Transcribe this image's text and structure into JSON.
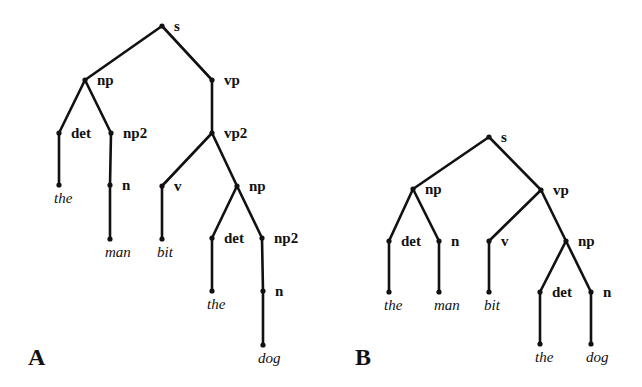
{
  "figure": {
    "panels": [
      {
        "id": "A",
        "label": "A",
        "label_pos": [
          28,
          345
        ],
        "nodes": [
          {
            "id": "s",
            "text": "s",
            "type": "cat",
            "x": 162,
            "y": 26
          },
          {
            "id": "np",
            "text": "np",
            "type": "cat",
            "x": 85,
            "y": 80
          },
          {
            "id": "vp",
            "text": "vp",
            "type": "cat",
            "x": 212,
            "y": 80
          },
          {
            "id": "det",
            "text": "det",
            "type": "cat",
            "x": 59,
            "y": 133
          },
          {
            "id": "np2",
            "text": "np2",
            "type": "cat",
            "x": 111,
            "y": 133
          },
          {
            "id": "vp2",
            "text": "vp2",
            "type": "cat",
            "x": 212,
            "y": 133
          },
          {
            "id": "the1",
            "text": "the",
            "type": "word",
            "x": 59,
            "y": 185
          },
          {
            "id": "n",
            "text": "n",
            "type": "cat",
            "x": 110,
            "y": 185
          },
          {
            "id": "v",
            "text": "v",
            "type": "cat",
            "x": 162,
            "y": 186
          },
          {
            "id": "np_b",
            "text": "np",
            "type": "cat",
            "x": 237,
            "y": 186
          },
          {
            "id": "man",
            "text": "man",
            "type": "word",
            "x": 110,
            "y": 239
          },
          {
            "id": "bit",
            "text": "bit",
            "type": "word",
            "x": 162,
            "y": 239
          },
          {
            "id": "det2",
            "text": "det",
            "type": "cat",
            "x": 212,
            "y": 238
          },
          {
            "id": "np2b",
            "text": "np2",
            "type": "cat",
            "x": 262,
            "y": 238
          },
          {
            "id": "the2",
            "text": "the",
            "type": "word",
            "x": 212,
            "y": 291
          },
          {
            "id": "n2",
            "text": "n",
            "type": "cat",
            "x": 263,
            "y": 291
          },
          {
            "id": "dog",
            "text": "dog",
            "type": "word",
            "x": 263,
            "y": 345
          }
        ],
        "edges": [
          [
            "s",
            "np"
          ],
          [
            "s",
            "vp"
          ],
          [
            "np",
            "det"
          ],
          [
            "np",
            "np2"
          ],
          [
            "vp",
            "vp2"
          ],
          [
            "det",
            "the1"
          ],
          [
            "np2",
            "n"
          ],
          [
            "n",
            "man"
          ],
          [
            "vp2",
            "v"
          ],
          [
            "vp2",
            "np_b"
          ],
          [
            "v",
            "bit"
          ],
          [
            "np_b",
            "det2"
          ],
          [
            "np_b",
            "np2b"
          ],
          [
            "det2",
            "the2"
          ],
          [
            "np2b",
            "n2"
          ],
          [
            "n2",
            "dog"
          ]
        ]
      },
      {
        "id": "B",
        "label": "B",
        "label_pos": [
          355,
          345
        ],
        "nodes": [
          {
            "id": "s",
            "text": "s",
            "type": "cat",
            "x": 489,
            "y": 137
          },
          {
            "id": "np",
            "text": "np",
            "type": "cat",
            "x": 413,
            "y": 189
          },
          {
            "id": "vp",
            "text": "vp",
            "type": "cat",
            "x": 541,
            "y": 190
          },
          {
            "id": "det",
            "text": "det",
            "type": "cat",
            "x": 389,
            "y": 241
          },
          {
            "id": "n",
            "text": "n",
            "type": "cat",
            "x": 439,
            "y": 241
          },
          {
            "id": "v",
            "text": "v",
            "type": "cat",
            "x": 489,
            "y": 241
          },
          {
            "id": "np_b",
            "text": "np",
            "type": "cat",
            "x": 566,
            "y": 241
          },
          {
            "id": "the1",
            "text": "the",
            "type": "word",
            "x": 389,
            "y": 292
          },
          {
            "id": "man",
            "text": "man",
            "type": "word",
            "x": 439,
            "y": 292
          },
          {
            "id": "bit",
            "text": "bit",
            "type": "word",
            "x": 489,
            "y": 292
          },
          {
            "id": "det2",
            "text": "det",
            "type": "cat",
            "x": 540,
            "y": 292
          },
          {
            "id": "n2",
            "text": "n",
            "type": "cat",
            "x": 591,
            "y": 292
          },
          {
            "id": "the2",
            "text": "the",
            "type": "word",
            "x": 540,
            "y": 344
          },
          {
            "id": "dog",
            "text": "dog",
            "type": "word",
            "x": 591,
            "y": 344
          }
        ],
        "edges": [
          [
            "s",
            "np"
          ],
          [
            "s",
            "vp"
          ],
          [
            "np",
            "det"
          ],
          [
            "np",
            "n"
          ],
          [
            "det",
            "the1"
          ],
          [
            "n",
            "man"
          ],
          [
            "vp",
            "v"
          ],
          [
            "vp",
            "np_b"
          ],
          [
            "v",
            "bit"
          ],
          [
            "np_b",
            "det2"
          ],
          [
            "np_b",
            "n2"
          ],
          [
            "det2",
            "the2"
          ],
          [
            "n2",
            "dog"
          ]
        ]
      }
    ]
  }
}
